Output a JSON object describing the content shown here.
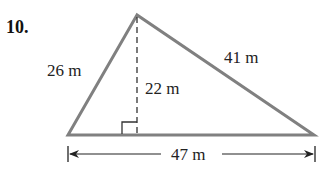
{
  "problem_number": "10.",
  "shape": "triangle",
  "labels": {
    "left_side": "26 m",
    "right_side": "41 m",
    "height": "22 m",
    "base": "47 m"
  },
  "colors": {
    "triangle_stroke": "#808080",
    "text": "#222222",
    "dimension_line": "#222222"
  }
}
